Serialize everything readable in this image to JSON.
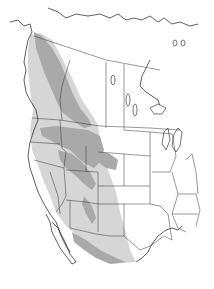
{
  "map": {
    "type": "species-range-map",
    "region": "Western North America",
    "colors": {
      "background": "#ffffff",
      "land": "#ffffff",
      "core_range": "#a9a9a9",
      "outer_range": "#d6d6d6",
      "boundaries": "#1a1a1a"
    },
    "legend": [],
    "labels": []
  }
}
